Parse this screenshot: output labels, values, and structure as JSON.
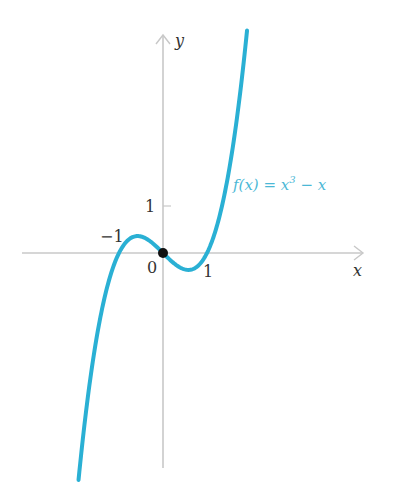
{
  "chart_data": {
    "type": "line",
    "title": "",
    "function": "f(x) = x^3 - x",
    "xlabel": "x",
    "ylabel": "y",
    "xlim": [
      -1.9,
      4.3
    ],
    "ylim": [
      -4.8,
      5.1
    ],
    "tick_labels": {
      "x": [
        "-1",
        "0",
        "1"
      ],
      "y": [
        "1"
      ]
    },
    "annotations": [
      {
        "text": "f(x) = x³ − x",
        "x": 1.6,
        "y": 1.5
      }
    ],
    "marked_points": [
      {
        "x": 0,
        "y": 0
      }
    ],
    "series": [
      {
        "name": "f(x) = x^3 - x",
        "color": "#2ab0d4",
        "x": [
          -1.9,
          -1.5,
          -1.0,
          -0.577,
          0,
          0.577,
          1.0,
          1.5,
          1.91
        ],
        "y": [
          -4.96,
          -1.88,
          0,
          0.385,
          0,
          -0.385,
          0,
          1.88,
          5.06
        ]
      }
    ],
    "grid": false,
    "legend": null
  },
  "labels": {
    "x_axis": "x",
    "y_axis": "y",
    "origin": "0",
    "tick_x_neg1": "−1",
    "tick_x_1": "1",
    "tick_y_1": "1",
    "function_label": "f(x) = x",
    "function_exp": "3",
    "function_tail": " − x"
  },
  "colors": {
    "curve": "#2ab0d4",
    "axis": "#c8c8c8",
    "point": "#111111"
  }
}
